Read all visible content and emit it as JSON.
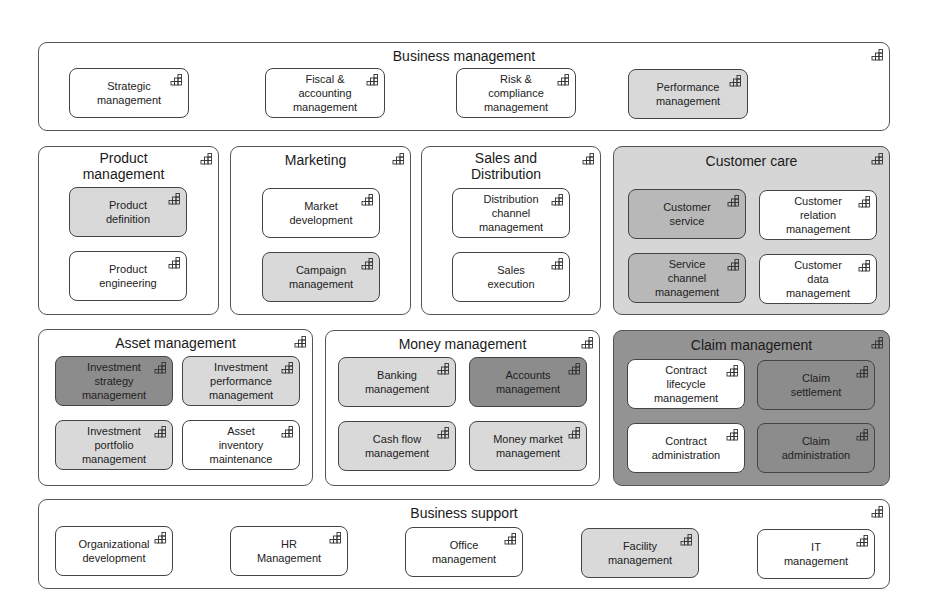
{
  "diagram": {
    "type": "capability-map",
    "icon": "capability-icon",
    "groups": {
      "business_management": {
        "title": "Business management",
        "items": [
          {
            "label": "Strategic\nmanagement",
            "shade": "white"
          },
          {
            "label": "Fiscal &\naccounting\nmanagement",
            "shade": "white"
          },
          {
            "label": "Risk &\ncompliance\nmanagement",
            "shade": "white"
          },
          {
            "label": "Performance\nmanagement",
            "shade": "light"
          }
        ]
      },
      "product_management": {
        "title": "Product\nmanagement",
        "items": [
          {
            "label": "Product\ndefinition",
            "shade": "light"
          },
          {
            "label": "Product\nengineering",
            "shade": "white"
          }
        ]
      },
      "marketing": {
        "title": "Marketing",
        "items": [
          {
            "label": "Market\ndevelopment",
            "shade": "white"
          },
          {
            "label": "Campaign\nmanagement",
            "shade": "light"
          }
        ]
      },
      "sales_distribution": {
        "title": "Sales and\nDistribution",
        "items": [
          {
            "label": "Distribution\nchannel\nmanagement",
            "shade": "white"
          },
          {
            "label": "Sales\nexecution",
            "shade": "white"
          }
        ]
      },
      "customer_care": {
        "title": "Customer care",
        "shade": "light",
        "items": [
          {
            "label": "Customer\nservice",
            "shade": "mid"
          },
          {
            "label": "Customer\nrelation\nmanagement",
            "shade": "white"
          },
          {
            "label": "Service\nchannel\nmanagement",
            "shade": "mid"
          },
          {
            "label": "Customer\ndata\nmanagement",
            "shade": "white"
          }
        ]
      },
      "asset_management": {
        "title": "Asset management",
        "items": [
          {
            "label": "Investment\nstrategy\nmanagement",
            "shade": "dark"
          },
          {
            "label": "Investment\nperformance\nmanagement",
            "shade": "light"
          },
          {
            "label": "Investment\nportfolio\nmanagement",
            "shade": "light"
          },
          {
            "label": "Asset\ninventory\nmaintenance",
            "shade": "white"
          }
        ]
      },
      "money_management": {
        "title": "Money management",
        "items": [
          {
            "label": "Banking\nmanagement",
            "shade": "light"
          },
          {
            "label": "Accounts\nmanagement",
            "shade": "dark"
          },
          {
            "label": "Cash flow\nmanagement",
            "shade": "light"
          },
          {
            "label": "Money market\nmanagement",
            "shade": "light"
          }
        ]
      },
      "claim_management": {
        "title": "Claim management",
        "shade": "dark",
        "items": [
          {
            "label": "Contract\nlifecycle\nmanagement",
            "shade": "white"
          },
          {
            "label": "Claim\nsettlement",
            "shade": "dark"
          },
          {
            "label": "Contract\nadministration",
            "shade": "white"
          },
          {
            "label": "Claim\nadministration",
            "shade": "dark"
          }
        ]
      },
      "business_support": {
        "title": "Business support",
        "items": [
          {
            "label": "Organizational\ndevelopment",
            "shade": "white"
          },
          {
            "label": "HR\nManagement",
            "shade": "white"
          },
          {
            "label": "Office\nmanagement",
            "shade": "white"
          },
          {
            "label": "Facility\nmanagement",
            "shade": "light"
          },
          {
            "label": "IT\nmanagement",
            "shade": "white"
          }
        ]
      }
    },
    "colors": {
      "white": "#ffffff",
      "light": "#d9d9d9",
      "mid": "#b8b8b8",
      "dark": "#8c8c8c",
      "border": "#444444"
    }
  }
}
